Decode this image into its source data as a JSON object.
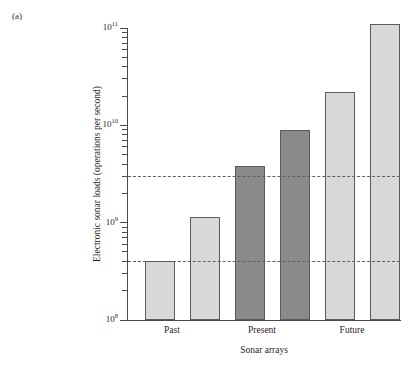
{
  "panel": {
    "label": "(a)"
  },
  "chart_data": {
    "type": "bar",
    "title": "",
    "subtitle": "",
    "xlabel": "Sonar arrays",
    "ylabel": "Electronic sonar loads (operations per second)",
    "yscale": "log",
    "ylim": [
      100000000,
      110000000000
    ],
    "y_axis_min_label": "10^8",
    "y_axis_max_label": "10^11",
    "grid": false,
    "legend": null,
    "categories": [
      "Past",
      "Present",
      "Future"
    ],
    "group_labels": [
      "Past",
      "Present",
      "Future"
    ],
    "bars": [
      {
        "index": 1,
        "group": "Past",
        "value": 400000000,
        "value_label": "4×10⁸",
        "color": "#d8d8d8",
        "shade": "light"
      },
      {
        "index": 2,
        "group": "Past",
        "value": 1150000000,
        "value_label": "1.15×10⁹",
        "color": "#d8d8d8",
        "shade": "light"
      },
      {
        "index": 3,
        "group": "Present",
        "value": 3800000000,
        "value_label": "3.8×10⁹",
        "color": "#8a8a8a",
        "shade": "dark"
      },
      {
        "index": 4,
        "group": "Present",
        "value": 9000000000,
        "value_label": "9×10⁹",
        "color": "#8a8a8a",
        "shade": "dark"
      },
      {
        "index": 5,
        "group": "Future",
        "value": 22000000000,
        "value_label": "2.2×10¹⁰",
        "color": "#d8d8d8",
        "shade": "light"
      },
      {
        "index": 6,
        "group": "Future",
        "value": 110000000000,
        "value_label": "1.1×10¹¹",
        "color": "#d8d8d8",
        "shade": "light"
      }
    ],
    "reference_lines": [
      {
        "name": "upper-threshold",
        "value": 3000000000,
        "value_label": "3×10⁹",
        "style": "dashed",
        "color": "#5f5f5f"
      },
      {
        "name": "lower-threshold",
        "value": 400000000,
        "value_label": "4×10⁸",
        "style": "dashed",
        "color": "#5f5f5f"
      }
    ],
    "y_major_ticks": [
      {
        "value": 100000000,
        "mantissa": "10",
        "exponent": "8"
      },
      {
        "value": 1000000000,
        "mantissa": "10",
        "exponent": "9"
      },
      {
        "value": 10000000000,
        "mantissa": "10",
        "exponent": "10"
      },
      {
        "value": 100000000000,
        "mantissa": "10",
        "exponent": "11"
      }
    ]
  },
  "colors": {
    "bar_light": "#d8d8d8",
    "bar_dark": "#8a8a8a",
    "bar_edge": "#5a5a5a",
    "axis": "#4a4a4a",
    "reference_line": "#5f5f5f",
    "text": "#1f1f1f",
    "background": "#ffffff"
  }
}
